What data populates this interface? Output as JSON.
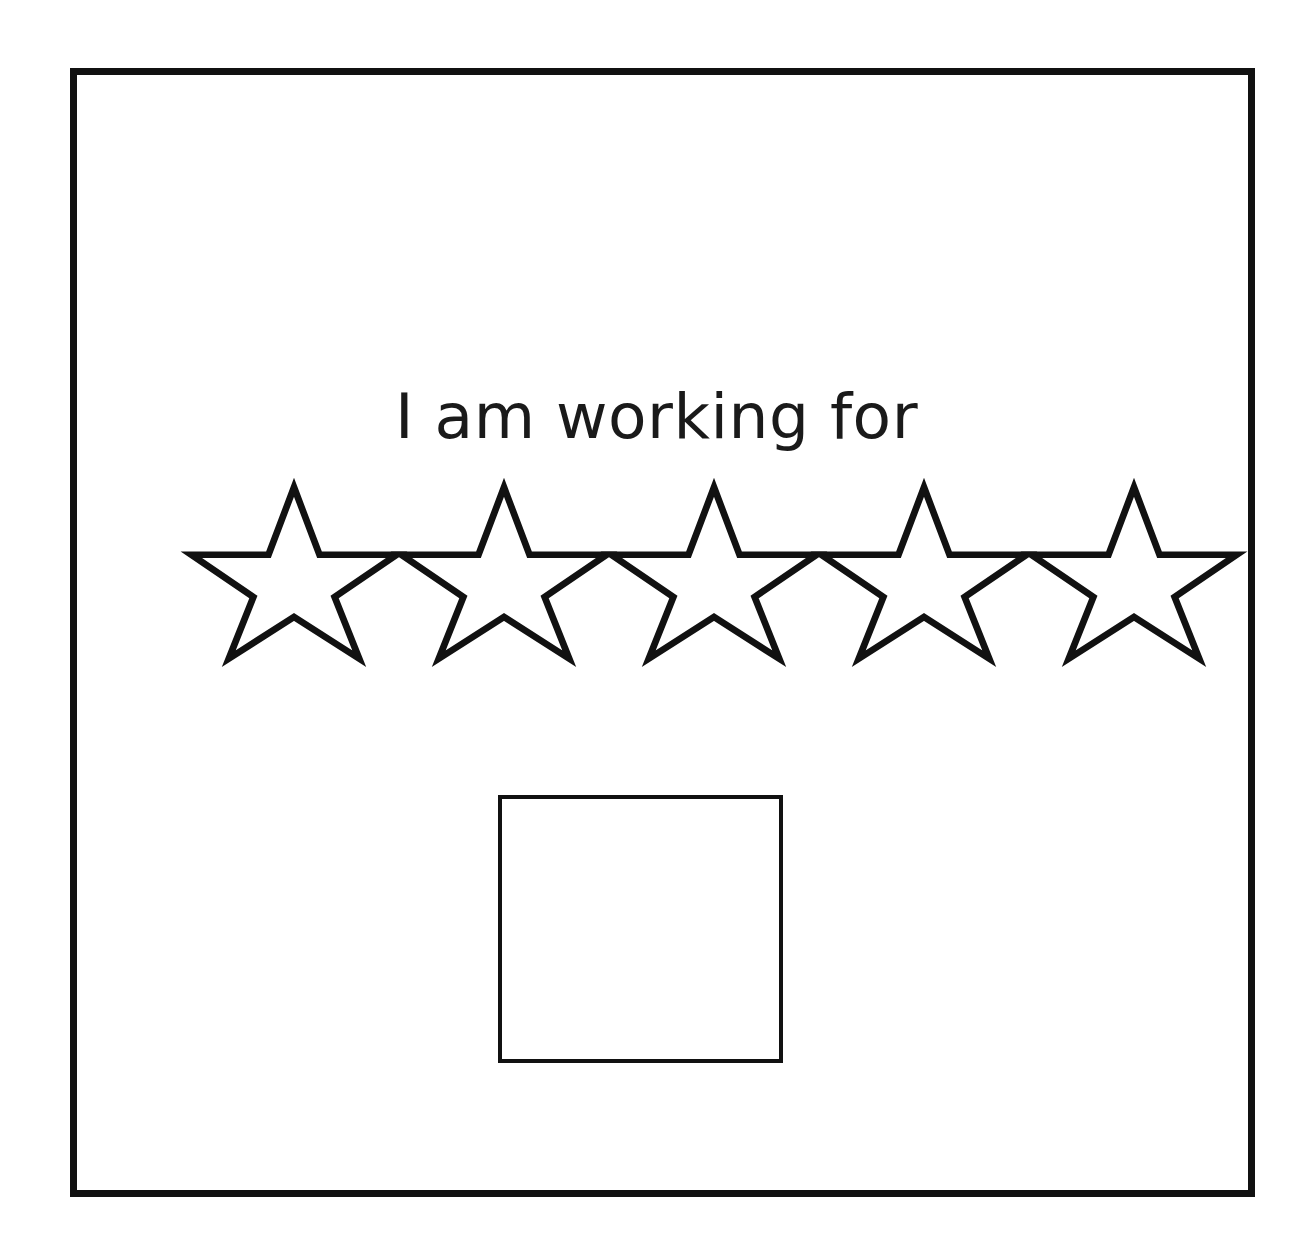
{
  "page": {
    "background_color": "#ffffff",
    "ink_color": "#111111",
    "text_color": "#1a1a1a"
  },
  "worksheet": {
    "frame": {
      "name": "outer-border",
      "stroke_color": "#111111",
      "stroke_width_px": 7
    },
    "prompt": {
      "text": "I am working for",
      "font_size_px": 63,
      "color": "#1a1a1a"
    },
    "rating": {
      "icon": "star-outline-icon",
      "total": 5,
      "filled": 0,
      "stars": [
        {
          "index": 1,
          "state": "empty",
          "label": "star-1"
        },
        {
          "index": 2,
          "state": "empty",
          "label": "star-2"
        },
        {
          "index": 3,
          "state": "empty",
          "label": "star-3"
        },
        {
          "index": 4,
          "state": "empty",
          "label": "star-4"
        },
        {
          "index": 5,
          "state": "empty",
          "label": "star-5"
        }
      ]
    },
    "answer_box": {
      "name": "reward-box",
      "value": "",
      "placeholder": "",
      "stroke_color": "#111111",
      "stroke_width_px": 4
    }
  }
}
